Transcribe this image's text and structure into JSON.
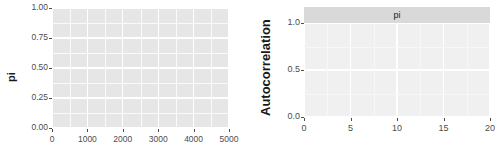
{
  "figure": {
    "background_color": "#ffffff",
    "width": 499,
    "height": 159
  },
  "chart_data": [
    {
      "id": "trace",
      "type": "line",
      "title": "",
      "xlabel": "",
      "ylabel": "pi",
      "xlim": [
        0,
        5000
      ],
      "ylim": [
        0.0,
        1.0
      ],
      "xticks": [
        0,
        1000,
        2000,
        3000,
        4000,
        5000
      ],
      "xtick_labels": [
        "0",
        "1000",
        "2000",
        "3000",
        "4000",
        "5000"
      ],
      "yticks": [
        0.0,
        0.25,
        0.5,
        0.75,
        1.0
      ],
      "ytick_labels": [
        "0.00",
        "0.25",
        "0.50",
        "0.75",
        "1.00"
      ],
      "grid": true,
      "legend": "none",
      "panel_background": "#e6e6e6",
      "gridline_color": "#ffffff",
      "series": [
        {
          "name": "pi",
          "color": "#808080",
          "line_width": 0.7,
          "description": "MCMC trace of pi over 5000 iterations, highly autocorrelated random walk spanning 0.00 to 1.00",
          "x": [
            0,
            25,
            50,
            75,
            100,
            125,
            150,
            175,
            200,
            225,
            250,
            275,
            300,
            325,
            350,
            375,
            400,
            425,
            450,
            475,
            500,
            525,
            550,
            575,
            600,
            625,
            650,
            675,
            700,
            725,
            750,
            775,
            800,
            825,
            850,
            875,
            900,
            925,
            950,
            975,
            1000,
            1025,
            1050,
            1075,
            1100,
            1125,
            1150,
            1175,
            1200,
            1225,
            1250,
            1275,
            1300,
            1325,
            1350,
            1375,
            1400,
            1425,
            1450,
            1475,
            1500,
            1525,
            1550,
            1575,
            1600,
            1625,
            1650,
            1675,
            1700,
            1725,
            1750,
            1775,
            1800,
            1825,
            1850,
            1875,
            1900,
            1925,
            1950,
            1975,
            2000,
            2025,
            2050,
            2075,
            2100,
            2125,
            2150,
            2175,
            2200,
            2225,
            2250,
            2275,
            2300,
            2325,
            2350,
            2375,
            2400,
            2425,
            2450,
            2475,
            2500,
            2525,
            2550,
            2575,
            2600,
            2625,
            2650,
            2675,
            2700,
            2725,
            2750,
            2775,
            2800,
            2825,
            2850,
            2875,
            2900,
            2925,
            2950,
            2975,
            3000,
            3025,
            3050,
            3075,
            3100,
            3125,
            3150,
            3175,
            3200,
            3225,
            3250,
            3275,
            3300,
            3325,
            3350,
            3375,
            3400,
            3425,
            3450,
            3475,
            3500,
            3525,
            3550,
            3575,
            3600,
            3625,
            3650,
            3675,
            3700,
            3725,
            3750,
            3775,
            3800,
            3825,
            3850,
            3875,
            3900,
            3925,
            3950,
            3975,
            4000,
            4025,
            4050,
            4075,
            4100,
            4125,
            4150,
            4175,
            4200,
            4225,
            4250,
            4275,
            4300,
            4325,
            4350,
            4375,
            4400,
            4425,
            4450,
            4475,
            4500,
            4525,
            4550,
            4575,
            4600,
            4625,
            4650,
            4675,
            4700,
            4725,
            4750,
            4775,
            4800,
            4825,
            4850,
            4875,
            4900,
            4925,
            4950,
            4975,
            5000
          ],
          "y": [
            0.46,
            0.52,
            0.6,
            0.66,
            0.62,
            0.68,
            0.74,
            0.69,
            0.8,
            0.93,
            0.74,
            0.72,
            0.8,
            0.6,
            0.52,
            0.62,
            0.48,
            0.38,
            0.08,
            0.22,
            0.36,
            0.46,
            0.52,
            0.6,
            0.68,
            0.76,
            0.82,
            0.78,
            0.86,
            0.9,
            0.84,
            0.96,
            0.88,
            0.8,
            0.86,
            0.94,
            0.99,
            0.86,
            0.74,
            0.8,
            0.7,
            0.62,
            0.54,
            0.5,
            0.44,
            0.4,
            0.46,
            0.38,
            0.3,
            0.28,
            0.34,
            0.24,
            0.18,
            0.12,
            0.16,
            0.08,
            0.04,
            0.02,
            0.1,
            0.06,
            0.02,
            0.04,
            0.14,
            0.08,
            0.04,
            0.1,
            0.2,
            0.42,
            0.68,
            0.52,
            0.66,
            0.44,
            0.46,
            0.4,
            0.36,
            0.42,
            0.38,
            0.34,
            0.4,
            0.36,
            0.44,
            0.56,
            0.62,
            0.48,
            0.4,
            0.36,
            0.22,
            0.1,
            0.06,
            0.14,
            0.08,
            0.04,
            0.02,
            0.08,
            0.14,
            0.2,
            0.3,
            0.38,
            0.44,
            0.52,
            0.6,
            0.72,
            0.88,
            0.99,
            0.84,
            0.66,
            0.52,
            0.46,
            0.4,
            0.36,
            0.44,
            0.38,
            0.46,
            0.54,
            0.42,
            0.36,
            0.4,
            0.34,
            0.38,
            0.44,
            0.4,
            0.46,
            0.38,
            0.34,
            0.42,
            0.36,
            0.3,
            0.24,
            0.18,
            0.12,
            0.08,
            0.04,
            0.1,
            0.06,
            0.12,
            0.28,
            0.44,
            0.62,
            0.58,
            0.66,
            0.74,
            0.62,
            0.7,
            0.82,
            0.9,
            0.96,
            0.86,
            0.7,
            0.62,
            0.78,
            0.96,
            0.88,
            0.74,
            0.6,
            0.52,
            0.44,
            0.36,
            0.3,
            0.24,
            0.16,
            0.08,
            0.04,
            0.1,
            0.06,
            0.14,
            0.22,
            0.18,
            0.26,
            0.2,
            0.16,
            0.22,
            0.26,
            0.18,
            0.24,
            0.2,
            0.14,
            0.22,
            0.18,
            0.26,
            0.3,
            0.36,
            0.26,
            0.32,
            0.26,
            0.34,
            0.42,
            0.5,
            0.58,
            0.66,
            0.74,
            0.7,
            0.78,
            0.86,
            0.82,
            0.9,
            0.99,
            0.92,
            0.84,
            0.96,
            0.88,
            0.94
          ]
        }
      ]
    },
    {
      "id": "acf",
      "type": "line",
      "title": "pi",
      "xlabel": "Lag",
      "ylabel": "Autocorrelation",
      "xlim": [
        0,
        20
      ],
      "ylim": [
        0.0,
        1.0
      ],
      "xticks": [
        0,
        5,
        10,
        15,
        20
      ],
      "xtick_labels": [
        "0",
        "5",
        "10",
        "15",
        "20"
      ],
      "yticks": [
        0.0,
        0.5,
        1.0
      ],
      "ytick_labels": [
        "0.0",
        "0.5",
        "1.0"
      ],
      "grid": true,
      "legend": "none",
      "panel_background": "#f0f0f0",
      "gridline_color": "#ffffff",
      "facet_strip_label": "pi",
      "facet_strip_background": "#d9d9d9",
      "reference_line": {
        "y": 0.0,
        "color": "#999999"
      },
      "series": [
        {
          "name": "autocorrelation",
          "color": "#333333",
          "line_width": 1.4,
          "x": [
            0,
            1,
            2,
            3,
            4,
            5,
            6,
            7,
            8,
            9,
            10,
            11,
            12,
            13,
            14,
            15,
            16,
            17,
            18,
            19,
            20
          ],
          "y": [
            1.0,
            0.993,
            0.987,
            0.98,
            0.974,
            0.967,
            0.961,
            0.954,
            0.948,
            0.941,
            0.935,
            0.928,
            0.922,
            0.915,
            0.909,
            0.902,
            0.896,
            0.889,
            0.883,
            0.876,
            0.87
          ]
        }
      ]
    }
  ]
}
